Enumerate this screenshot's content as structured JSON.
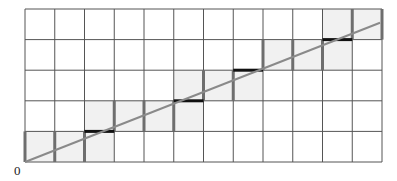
{
  "diagram": {
    "type": "grid-line-traversal",
    "origin_label": "0",
    "grid": {
      "columns": 12,
      "rows": 5,
      "left": 25,
      "top": 9,
      "right": 382,
      "bottom": 162
    },
    "line": {
      "from": [
        0,
        0
      ],
      "to": [
        12,
        4.55
      ]
    },
    "shaded_cells": [
      [
        0,
        0
      ],
      [
        1,
        0
      ],
      [
        2,
        0
      ],
      [
        2,
        1
      ],
      [
        3,
        1
      ],
      [
        4,
        1
      ],
      [
        5,
        1
      ],
      [
        5,
        2
      ],
      [
        6,
        2
      ],
      [
        7,
        2
      ],
      [
        8,
        3
      ],
      [
        9,
        3
      ],
      [
        10,
        3
      ],
      [
        10,
        4
      ],
      [
        11,
        4
      ]
    ],
    "vertical_crossings": [
      [
        0,
        0
      ],
      [
        1,
        0
      ],
      [
        2,
        0
      ],
      [
        3,
        1
      ],
      [
        4,
        1
      ],
      [
        5,
        1
      ],
      [
        6,
        2
      ],
      [
        7,
        2
      ],
      [
        8,
        3
      ],
      [
        9,
        3
      ],
      [
        10,
        3
      ],
      [
        11,
        4
      ],
      [
        12,
        4
      ]
    ],
    "horizontal_crossings": [
      [
        2,
        1
      ],
      [
        5,
        2
      ],
      [
        7,
        3
      ],
      [
        10,
        4
      ]
    ],
    "colors": {
      "grid": "#555555",
      "shade": "#f1f1f1",
      "line": "#8a8a8a",
      "vertical_crossing": "#6e6e6e",
      "horizontal_crossing": "#111111"
    }
  }
}
